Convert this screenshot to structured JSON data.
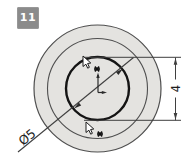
{
  "badge": {
    "label": "11",
    "bg": "#8b8b8b",
    "text_color": "#ffffff"
  },
  "drawing": {
    "type": "cad-sketch-concentric-circles",
    "labels": {
      "vertical_dim": "4",
      "diameter_dim": "Ø5"
    },
    "colors": {
      "part_fill": "#e4e3e0",
      "edge": "#4f4f4f",
      "bold_edge": "#141414",
      "dim_line": "#3f3f3f",
      "dim_text": "#1e1e1e"
    },
    "icons": [
      "origin-icon",
      "sketch-cursor-icon"
    ]
  }
}
